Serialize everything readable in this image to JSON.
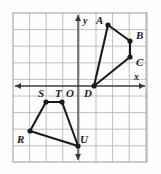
{
  "figure": {
    "colors": {
      "background": "#fefefe",
      "grid_line": "#b9b9b9",
      "grid_border": "#9a9a9a",
      "axis": "#3a3a3a",
      "shape_stroke": "#1b1b1b",
      "vertex_fill": "#1b1b1b",
      "label_text": "#1b1b1b"
    },
    "grid": {
      "left": 13,
      "top": 13,
      "right": 147,
      "bottom": 162,
      "cell_size": 16.6,
      "columns": 8,
      "rows": 9
    },
    "axes": {
      "x_axis_y": 86,
      "y_axis_x": 78,
      "x_label": "x",
      "y_label": "y",
      "origin_label": "O",
      "x_label_pos": {
        "x": 134,
        "y": 72
      },
      "y_label_pos": {
        "x": 83,
        "y": 16
      },
      "origin_label_pos": {
        "x": 66,
        "y": 88
      }
    },
    "shapes": [
      {
        "name": "quadrilateral-abcd",
        "closed": true,
        "vertices": [
          {
            "label": "A",
            "x": 108,
            "y": 25,
            "label_x": 96,
            "label_y": 15
          },
          {
            "label": "B",
            "x": 130,
            "y": 41,
            "label_x": 136,
            "label_y": 30
          },
          {
            "label": "C",
            "x": 130,
            "y": 57,
            "label_x": 136,
            "label_y": 57
          },
          {
            "label": "D",
            "x": 94,
            "y": 86,
            "label_x": 84,
            "label_y": 88
          }
        ]
      },
      {
        "name": "quadrilateral-rstu",
        "closed": true,
        "vertices": [
          {
            "label": "R",
            "x": 30,
            "y": 131,
            "label_x": 17,
            "label_y": 134
          },
          {
            "label": "S",
            "x": 46,
            "y": 102,
            "label_x": 38,
            "label_y": 88
          },
          {
            "label": "T",
            "x": 62,
            "y": 102,
            "label_x": 55,
            "label_y": 88
          },
          {
            "label": "U",
            "x": 78,
            "y": 146,
            "label_x": 80,
            "label_y": 134
          }
        ]
      }
    ]
  }
}
